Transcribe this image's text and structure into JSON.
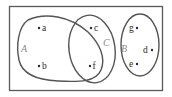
{
  "diagram": {
    "type": "venn",
    "universe": {
      "label": ""
    },
    "sets": [
      {
        "id": "A",
        "label": "A",
        "elements": [
          "a",
          "b",
          "f"
        ]
      },
      {
        "id": "C",
        "label": "C",
        "elements": [
          "c",
          "f"
        ]
      },
      {
        "id": "B",
        "label": "B",
        "elements": [
          "g",
          "d",
          "e"
        ]
      }
    ],
    "elements": [
      {
        "id": "a",
        "label": "a"
      },
      {
        "id": "b",
        "label": "b"
      },
      {
        "id": "c",
        "label": "c"
      },
      {
        "id": "f",
        "label": "f"
      },
      {
        "id": "g",
        "label": "g"
      },
      {
        "id": "d",
        "label": "d"
      },
      {
        "id": "e",
        "label": "e"
      }
    ],
    "colors": {
      "outline": "#555555",
      "set_label": "#8a8a8a",
      "element": "#2a2a2a",
      "background": "#ffffff"
    }
  }
}
